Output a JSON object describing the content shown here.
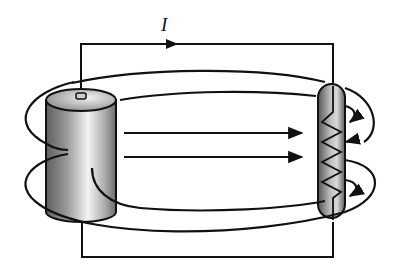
{
  "diagram": {
    "current_label": "I",
    "components": [
      {
        "name": "battery",
        "shape": "shaded cylinder",
        "terminal": "top"
      },
      {
        "name": "resistor",
        "shape": "shaded capsule with zigzag coil"
      },
      {
        "name": "wire-top",
        "direction": "left-to-right",
        "arrow": true
      },
      {
        "name": "wire-bottom"
      },
      {
        "name": "field-loops",
        "count": 2
      },
      {
        "name": "field-arrows",
        "count": 2,
        "direction": "right"
      }
    ],
    "colors": {
      "line": "#111111",
      "background": "#ffffff",
      "shade_dark": "#6a6a6a",
      "shade_light": "#f2f2f2"
    }
  }
}
